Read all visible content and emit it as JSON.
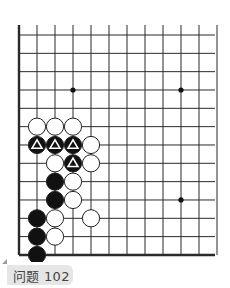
{
  "board": {
    "columns": 12,
    "rows": 13,
    "origin_x": 19,
    "origin_y": 35,
    "spacing_x": 18,
    "spacing_y": 18.33,
    "line_color": "#2a2a2a",
    "edges": [
      "left",
      "bottom"
    ],
    "star_points": [
      {
        "col": 3,
        "row": 3
      },
      {
        "col": 9,
        "row": 3
      },
      {
        "col": 9,
        "row": 9
      }
    ],
    "stones": [
      {
        "col": 1,
        "row": 5,
        "color": "white"
      },
      {
        "col": 2,
        "row": 5,
        "color": "white"
      },
      {
        "col": 3,
        "row": 5,
        "color": "white"
      },
      {
        "col": 1,
        "row": 6,
        "color": "black",
        "mark": "triangle"
      },
      {
        "col": 2,
        "row": 6,
        "color": "black",
        "mark": "triangle"
      },
      {
        "col": 3,
        "row": 6,
        "color": "black",
        "mark": "triangle"
      },
      {
        "col": 4,
        "row": 6,
        "color": "white"
      },
      {
        "col": 2,
        "row": 7,
        "color": "white"
      },
      {
        "col": 3,
        "row": 7,
        "color": "black",
        "mark": "triangle"
      },
      {
        "col": 4,
        "row": 7,
        "color": "white"
      },
      {
        "col": 2,
        "row": 8,
        "color": "black"
      },
      {
        "col": 3,
        "row": 8,
        "color": "white"
      },
      {
        "col": 2,
        "row": 9,
        "color": "black"
      },
      {
        "col": 3,
        "row": 9,
        "color": "white"
      },
      {
        "col": 1,
        "row": 10,
        "color": "black"
      },
      {
        "col": 2,
        "row": 10,
        "color": "white"
      },
      {
        "col": 4,
        "row": 10,
        "color": "white"
      },
      {
        "col": 1,
        "row": 11,
        "color": "black"
      },
      {
        "col": 2,
        "row": 11,
        "color": "white"
      },
      {
        "col": 1,
        "row": 12,
        "color": "black"
      }
    ]
  },
  "label": {
    "text": "问题 102"
  }
}
